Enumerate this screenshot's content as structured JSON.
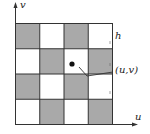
{
  "diagram": {
    "type": "checkerboard-grid",
    "rows": 4,
    "cols": 4,
    "pattern": [
      [
        "gray",
        "white",
        "gray",
        "white"
      ],
      [
        "white",
        "gray",
        "white",
        "gray"
      ],
      [
        "gray",
        "white",
        "gray",
        "white"
      ],
      [
        "white",
        "gray",
        "white",
        "gray"
      ]
    ],
    "colors": {
      "gray": "#a9a9a9",
      "white": "#ffffff",
      "line": "#333333"
    },
    "axes": {
      "x_label": "u",
      "y_label": "v"
    },
    "labels": {
      "cell_size": "h",
      "point": "(u,v)"
    }
  }
}
